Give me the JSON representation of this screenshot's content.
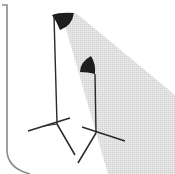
{
  "illustration": {
    "subject": "two studio light stands",
    "colors": {
      "background": "#ffffff",
      "beam": "#dcdcdc",
      "stand": "#2a2a2a",
      "frame": "#8a8a8a"
    }
  }
}
